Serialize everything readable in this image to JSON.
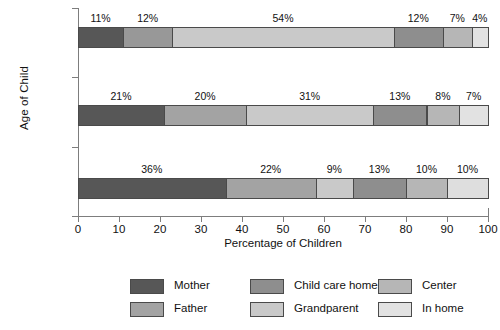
{
  "chart_data": {
    "type": "bar",
    "orientation": "horizontal",
    "stacked": true,
    "stacked_percent": true,
    "title": "",
    "xlabel": "Percentage of Children",
    "ylabel": "Age of Child",
    "xlim": [
      0,
      100
    ],
    "xticks": [
      0,
      10,
      20,
      30,
      40,
      50,
      60,
      70,
      80,
      90,
      100
    ],
    "xtick_labels": [
      "0",
      "10",
      "20",
      "30",
      "40",
      "50",
      "60",
      "70",
      "80",
      "90",
      "100"
    ],
    "grid": false,
    "legend_position": "bottom",
    "categories": [
      "4 ½ Years",
      "3 Years",
      "6 Months"
    ],
    "category_labels_html": [
      "4 ½ Years",
      "3 Years",
      "6 Months"
    ],
    "series": [
      {
        "name": "Mother",
        "color": "#575757",
        "values": [
          11,
          21,
          36
        ]
      },
      {
        "name": "Father",
        "color": "#989898",
        "values": [
          12,
          20,
          22
        ]
      },
      {
        "name": "Child care home",
        "color": "#7e7e7e",
        "values": [
          54,
          31,
          9
        ]
      },
      {
        "name": "Grandparent",
        "color": "#c2c2c2",
        "values": [
          12,
          13,
          13
        ]
      },
      {
        "name": "Center",
        "color": "#b0b0b0",
        "values": [
          7,
          8,
          10
        ]
      },
      {
        "name": "In home",
        "color": "#dcdcdc",
        "values": [
          4,
          7,
          10
        ]
      }
    ],
    "bars": [
      {
        "category": "4 ½ Years",
        "segments": [
          {
            "label": "11%",
            "value": 11,
            "series": "Mother",
            "color": "#575757"
          },
          {
            "label": "12%",
            "value": 12,
            "series": "Father",
            "color": "#989898"
          },
          {
            "label": "54%",
            "value": 54,
            "series": "Center",
            "color": "#c9c9c9"
          },
          {
            "label": "12%",
            "value": 12,
            "series": "Child care home",
            "color": "#8e8e8e"
          },
          {
            "label": "7%",
            "value": 7,
            "series": "Grandparent",
            "color": "#b6b6b6"
          },
          {
            "label": "4%",
            "value": 4,
            "series": "In home",
            "color": "#e2e2e2"
          }
        ]
      },
      {
        "category": "3 Years",
        "segments": [
          {
            "label": "21%",
            "value": 21,
            "series": "Mother",
            "color": "#575757"
          },
          {
            "label": "20%",
            "value": 20,
            "series": "Father",
            "color": "#a3a3a3"
          },
          {
            "label": "31%",
            "value": 31,
            "series": "Center",
            "color": "#c9c9c9"
          },
          {
            "label": "13%",
            "value": 13,
            "series": "Child care home",
            "color": "#8e8e8e"
          },
          {
            "label": "8%",
            "value": 8,
            "series": "Grandparent",
            "color": "#b6b6b6"
          },
          {
            "label": "7%",
            "value": 7,
            "series": "In home",
            "color": "#e2e2e2"
          }
        ]
      },
      {
        "category": "6 Months",
        "segments": [
          {
            "label": "36%",
            "value": 36,
            "series": "Mother",
            "color": "#575757"
          },
          {
            "label": "22%",
            "value": 22,
            "series": "Father",
            "color": "#a3a3a3"
          },
          {
            "label": "9%",
            "value": 9,
            "series": "Center",
            "color": "#c9c9c9"
          },
          {
            "label": "13%",
            "value": 13,
            "series": "Child care home",
            "color": "#8e8e8e"
          },
          {
            "label": "10%",
            "value": 10,
            "series": "Grandparent",
            "color": "#b6b6b6"
          },
          {
            "label": "10%",
            "value": 10,
            "series": "In home",
            "color": "#dedede"
          }
        ]
      }
    ],
    "legend": [
      {
        "name": "Mother",
        "color": "#575757",
        "col": 0,
        "row": 0
      },
      {
        "name": "Father",
        "color": "#a3a3a3",
        "col": 0,
        "row": 1
      },
      {
        "name": "Child care home",
        "color": "#8e8e8e",
        "col": 1,
        "row": 0
      },
      {
        "name": "Grandparent",
        "color": "#c9c9c9",
        "col": 1,
        "row": 1
      },
      {
        "name": "Center",
        "color": "#b6b6b6",
        "col": 2,
        "row": 0
      },
      {
        "name": "In home",
        "color": "#e2e2e2",
        "col": 2,
        "row": 1
      }
    ]
  }
}
